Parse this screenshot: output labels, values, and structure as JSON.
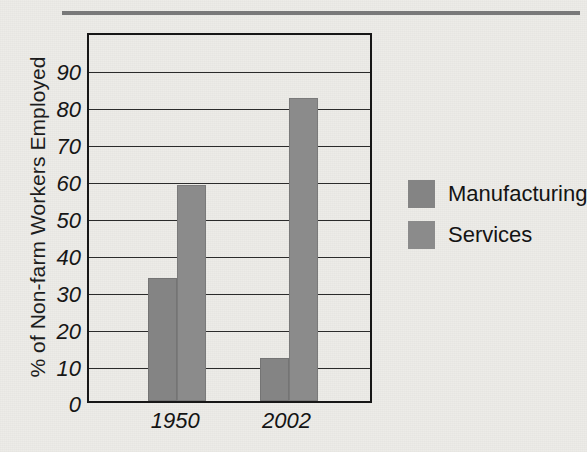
{
  "figure": {
    "background_color": "#edece8",
    "top_rule_color": "#6f6f70"
  },
  "chart_data": {
    "type": "bar",
    "title": "",
    "xlabel": "",
    "ylabel": "% of Non-farm Workers Employed",
    "categories": [
      "1950",
      "2002"
    ],
    "series": [
      {
        "name": "Manufacturing",
        "values": [
          33.3,
          11.6
        ],
        "color": "#848484"
      },
      {
        "name": "Services",
        "values": [
          58.3,
          81.8
        ],
        "color": "#8b8b8b"
      }
    ],
    "ylim": [
      0,
      100
    ],
    "yticks": [
      0,
      10,
      20,
      30,
      40,
      50,
      60,
      70,
      80,
      90
    ],
    "ytick_labels": [
      "0",
      "10",
      "20",
      "30",
      "40",
      "50",
      "60",
      "70",
      "80",
      "90"
    ],
    "grid": true,
    "grid_axis": "y",
    "legend_position": "right",
    "legend_entries": [
      "Manufacturing",
      "Services"
    ],
    "bars_adjacent": true
  }
}
